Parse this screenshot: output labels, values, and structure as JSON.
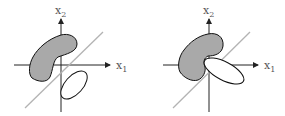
{
  "figure": {
    "panels": [
      {
        "id": "left",
        "x_axis_label": "x",
        "x_axis_sub": "1",
        "y_axis_label": "x",
        "y_axis_sub": "2",
        "description": "Gray non-convex region and white ellipse separated by a diagonal line; regions do not touch"
      },
      {
        "id": "right",
        "x_axis_label": "x",
        "x_axis_sub": "1",
        "y_axis_label": "x",
        "y_axis_sub": "2",
        "description": "Gray non-convex region and white ellipse touching at the separating diagonal line"
      }
    ],
    "colors": {
      "blob_fill": "#a9a9a9",
      "outline": "#111111",
      "separator_line": "#b3b3b3",
      "axis": "#222222",
      "background": "#ffffff"
    }
  }
}
